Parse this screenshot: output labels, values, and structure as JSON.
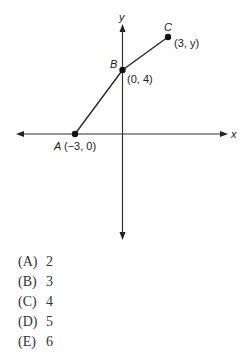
{
  "figure": {
    "axis_labels": {
      "x": "x",
      "y": "y"
    },
    "points": [
      {
        "name": "A",
        "coord_label": "(−3, 0)"
      },
      {
        "name": "B",
        "coord_label": "(0, 4)"
      },
      {
        "name": "C",
        "coord_label": "(3, y)"
      }
    ]
  },
  "choices": [
    {
      "letter": "(A)",
      "value": "2"
    },
    {
      "letter": "(B)",
      "value": "3"
    },
    {
      "letter": "(C)",
      "value": "4"
    },
    {
      "letter": "(D)",
      "value": "5"
    },
    {
      "letter": "(E)",
      "value": "6"
    }
  ]
}
